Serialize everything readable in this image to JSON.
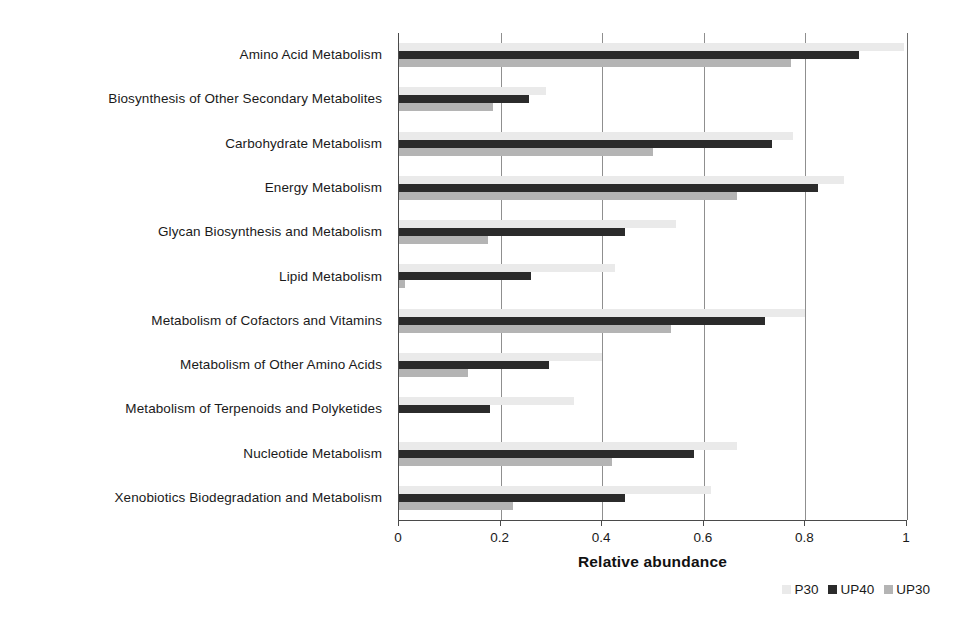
{
  "chart_data": {
    "type": "bar",
    "orientation": "horizontal",
    "title": "",
    "xlabel": "Relative abundance",
    "ylabel": "",
    "xlim": [
      0,
      1
    ],
    "xticks": [
      "0",
      "0.2",
      "0.4",
      "0.6",
      "0.8",
      "1"
    ],
    "xtick_values": [
      0,
      0.2,
      0.4,
      0.6,
      0.8,
      1
    ],
    "grid": true,
    "grid_axis": "x",
    "legend_position": "bottom-right",
    "categories": [
      "Amino Acid Metabolism",
      "Biosynthesis of Other Secondary Metabolites",
      "Carbohydrate Metabolism",
      "Energy Metabolism",
      "Glycan Biosynthesis and Metabolism",
      "Lipid Metabolism",
      "Metabolism of Cofactors and Vitamins",
      "Metabolism of Other Amino Acids",
      "Metabolism of Terpenoids and Polyketides",
      "Nucleotide Metabolism",
      "Xenobiotics Biodegradation and Metabolism"
    ],
    "series": [
      {
        "name": "P30",
        "color": "#eaeaea",
        "values": [
          0.995,
          0.29,
          0.775,
          0.875,
          0.545,
          0.425,
          0.8,
          0.4,
          0.345,
          0.665,
          0.615
        ]
      },
      {
        "name": "UP40",
        "color": "#2b2b2b",
        "values": [
          0.905,
          0.255,
          0.735,
          0.825,
          0.445,
          0.26,
          0.72,
          0.295,
          0.18,
          0.58,
          0.445
        ]
      },
      {
        "name": "UP30",
        "color": "#b4b4b4",
        "values": [
          0.772,
          0.185,
          0.5,
          0.665,
          0.175,
          0.012,
          0.535,
          0.135,
          0.0,
          0.42,
          0.225
        ]
      }
    ]
  }
}
